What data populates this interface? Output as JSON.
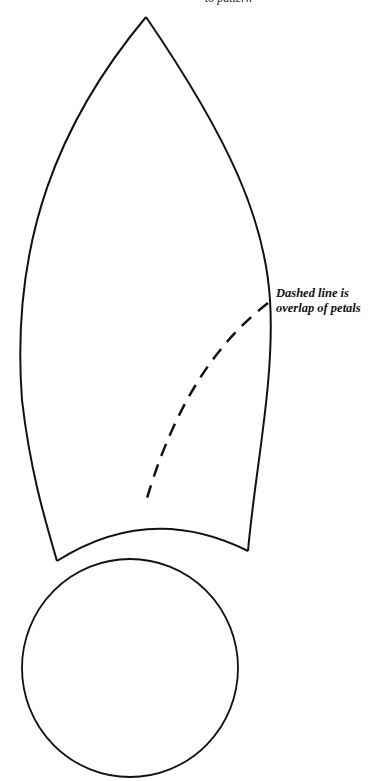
{
  "top_caption": "to pattern",
  "annotation": {
    "line1": "Dashed line is",
    "line2": "overlap of petals"
  },
  "colors": {
    "stroke": "#111111",
    "background": "#ffffff"
  }
}
